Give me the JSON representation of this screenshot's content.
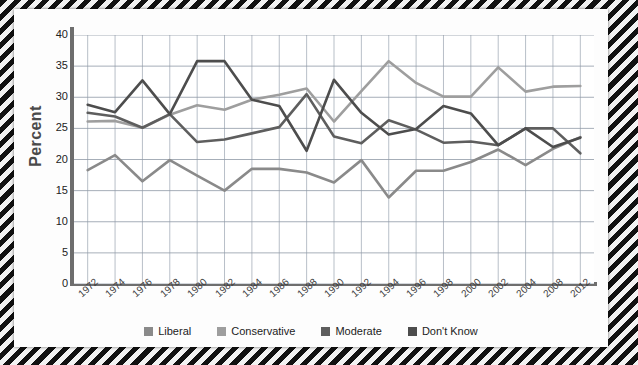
{
  "chart_data": {
    "type": "line",
    "title": "",
    "xlabel": "",
    "ylabel": "Percent",
    "ylim": [
      0,
      40
    ],
    "yticks": [
      40,
      35,
      30,
      25,
      20,
      15,
      10,
      5,
      0
    ],
    "grid": true,
    "legend_position": "bottom",
    "categories": [
      "1972",
      "1974",
      "1976",
      "1978",
      "1980",
      "1982",
      "1984",
      "1986",
      "1988",
      "1990",
      "1992",
      "1994",
      "1996",
      "1998",
      "2000",
      "2002",
      "2004",
      "2008",
      "2012"
    ],
    "series": [
      {
        "name": "Liberal",
        "color": "#8a8a8a",
        "values": [
          18.3,
          20.7,
          16.5,
          19.9,
          17.4,
          15.0,
          18.5,
          18.5,
          17.9,
          16.3,
          19.9,
          13.9,
          18.2,
          18.2,
          19.6,
          21.6,
          19.1,
          21.7,
          23.6
        ]
      },
      {
        "name": "Conservative",
        "color": "#9e9e9e",
        "values": [
          26.1,
          26.2,
          25.1,
          27.2,
          28.7,
          28.0,
          29.6,
          30.4,
          31.4,
          26.1,
          31.0,
          35.8,
          32.3,
          30.1,
          30.1,
          34.8,
          30.9,
          31.7,
          31.8
        ]
      },
      {
        "name": "Moderate",
        "color": "#5e5e5e",
        "values": [
          27.5,
          26.9,
          25.1,
          27.3,
          22.8,
          23.2,
          24.2,
          25.2,
          30.5,
          23.7,
          22.6,
          26.3,
          24.8,
          22.7,
          22.9,
          22.3,
          25.0,
          25.0,
          21.0
        ]
      },
      {
        "name": "Don't Know",
        "color": "#4d4d4d",
        "values": [
          28.8,
          27.6,
          32.7,
          27.3,
          35.8,
          35.8,
          29.6,
          28.6,
          21.4,
          32.8,
          27.5,
          24.0,
          24.9,
          28.6,
          27.4,
          22.3,
          25.0,
          22.0,
          23.5
        ]
      }
    ]
  },
  "legend": {
    "items": [
      {
        "label": "Liberal",
        "color": "#8a8a8a"
      },
      {
        "label": "Conservative",
        "color": "#9e9e9e"
      },
      {
        "label": "Moderate",
        "color": "#5e5e5e"
      },
      {
        "label": "Don't Know",
        "color": "#4d4d4d"
      }
    ]
  },
  "axis": {
    "y_title": "Percent"
  }
}
